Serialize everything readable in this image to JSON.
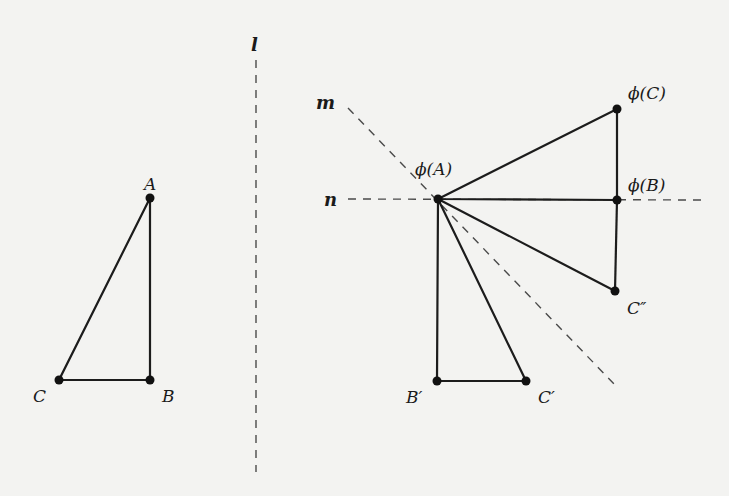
{
  "figure": {
    "lines": {
      "l": {
        "label": "l",
        "x1": 256,
        "y1": 60,
        "x2": 256,
        "y2": 472
      },
      "m": {
        "label": "m",
        "x1": 348,
        "y1": 108,
        "x2": 616,
        "y2": 386
      },
      "n": {
        "label": "n",
        "x1": 348,
        "y1": 199,
        "x2": 704,
        "y2": 200
      }
    },
    "points": {
      "A": {
        "label": "A",
        "x": 150,
        "y": 198
      },
      "B": {
        "label": "B",
        "x": 150,
        "y": 380
      },
      "C": {
        "label": "C",
        "x": 59,
        "y": 380
      },
      "phiA": {
        "label": "ϕ(A)",
        "x": 438,
        "y": 199
      },
      "phiB": {
        "label": "ϕ(B)",
        "x": 617,
        "y": 200
      },
      "phiC": {
        "label": "ϕ(C)",
        "x": 617,
        "y": 109
      },
      "Bp": {
        "label": "B′",
        "x": 437,
        "y": 381
      },
      "Cp": {
        "label": "C′",
        "x": 526,
        "y": 381
      },
      "Cpp": {
        "label": "C″",
        "x": 615,
        "y": 291
      }
    },
    "triangles": [
      {
        "name": "ABC",
        "vertices": [
          "A",
          "B",
          "C"
        ]
      },
      {
        "name": "phi-image",
        "vertices": [
          "phiA",
          "phiB",
          "phiC"
        ]
      },
      {
        "name": "prime-image",
        "vertices": [
          "phiA",
          "Bp",
          "Cp"
        ]
      },
      {
        "name": "double-prime-image",
        "vertices": [
          "phiA",
          "phiB",
          "Cpp"
        ]
      }
    ],
    "colors": {
      "stroke": "#1c1c1c",
      "dash": "#4a4a4a",
      "background": "#f3f3f1"
    }
  }
}
